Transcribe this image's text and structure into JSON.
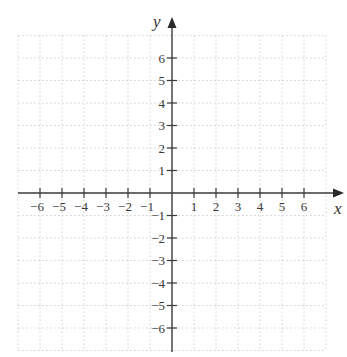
{
  "figure": {
    "x_axis_label": "x",
    "y_axis_label": "y",
    "x_tick_labels": [
      "−6",
      "−5",
      "−4",
      "−3",
      "−2",
      "−1",
      "1",
      "2",
      "3",
      "4",
      "5",
      "6"
    ],
    "y_tick_labels": [
      "6",
      "5",
      "4",
      "3",
      "2",
      "1",
      "−1",
      "−2",
      "−3",
      "−4",
      "−5",
      "−6"
    ],
    "x_tick_values": [
      -6,
      -5,
      -4,
      -3,
      -2,
      -1,
      1,
      2,
      3,
      4,
      5,
      6
    ],
    "y_tick_values": [
      6,
      5,
      4,
      3,
      2,
      1,
      -1,
      -2,
      -3,
      -4,
      -5,
      -6
    ],
    "grid": {
      "range": [
        -7,
        7
      ],
      "style": "dotted",
      "color": "#cfcfcf"
    },
    "colors": {
      "axis": "#3a3a3a",
      "grid": "#cfcfcf",
      "background": "#ffffff"
    }
  }
}
